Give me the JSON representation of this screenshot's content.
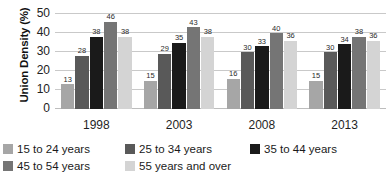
{
  "chart_data": {
    "type": "bar",
    "title": "",
    "xlabel": "",
    "ylabel": "Union Density (%)",
    "ylim": [
      0,
      50
    ],
    "yticks": [
      0,
      10,
      20,
      30,
      40,
      50
    ],
    "grid": true,
    "legend_position": "bottom",
    "categories": [
      "1998",
      "2003",
      "2008",
      "2013"
    ],
    "series": [
      {
        "name": "15 to 24 years",
        "color": "#a6a6a6",
        "values": [
          13,
          15,
          16,
          15
        ]
      },
      {
        "name": "25 to 34 years",
        "color": "#595959",
        "values": [
          28,
          29,
          30,
          30
        ]
      },
      {
        "name": "35 to 44 years",
        "color": "#1a1a1a",
        "values": [
          38,
          35,
          33,
          34
        ]
      },
      {
        "name": "45 to 54 years",
        "color": "#757575",
        "values": [
          46,
          43,
          40,
          38
        ]
      },
      {
        "name": "55 years and over",
        "color": "#d4d4d4",
        "values": [
          38,
          38,
          36,
          36
        ]
      }
    ]
  }
}
